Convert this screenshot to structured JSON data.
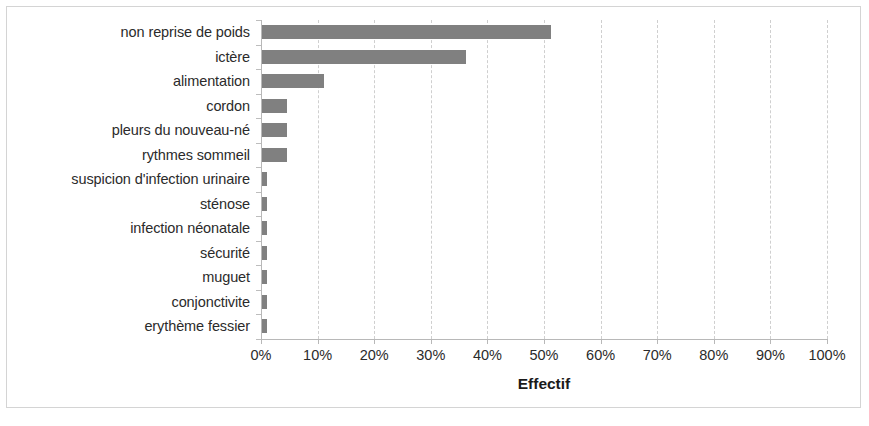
{
  "chart_data": {
    "type": "bar",
    "orientation": "horizontal",
    "title": "",
    "xlabel": "Effectif",
    "ylabel": "",
    "xlim": [
      0,
      100
    ],
    "xtick_labels": [
      "0%",
      "10%",
      "20%",
      "30%",
      "40%",
      "50%",
      "60%",
      "70%",
      "80%",
      "90%",
      "100%"
    ],
    "xtick_values": [
      0,
      10,
      20,
      30,
      40,
      50,
      60,
      70,
      80,
      90,
      100
    ],
    "grid": "vertical dashed gridlines at every 10%",
    "legend": "none",
    "value_unit": "percent",
    "bar_color": "#808080",
    "categories": [
      "non reprise de poids",
      "ictère",
      "alimentation",
      "cordon",
      "pleurs du nouveau-né",
      "rythmes sommeil",
      "suspicion d'infection urinaire",
      "sténose",
      "infection néonatale",
      "sécurité",
      "muguet",
      "conjonctivite",
      "erythème fessier"
    ],
    "values": [
      51,
      36,
      11,
      4.5,
      4.5,
      4.5,
      0.9,
      0.9,
      0.9,
      0.9,
      0.9,
      0.9,
      0.9
    ]
  },
  "colors": {
    "bar": "#808080",
    "gridline": "#cfcfcf",
    "axis": "#b8b8b8",
    "text": "#2b2b2b",
    "frame": "#d4d4d4",
    "background": "#ffffff"
  }
}
